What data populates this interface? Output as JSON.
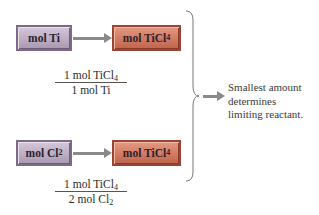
{
  "diagram": {
    "row1": {
      "from_box": {
        "text": "mol Ti",
        "color": "#bcaec4"
      },
      "to_box": {
        "text": "mol TiCl",
        "sub": "4",
        "color": "#d27a62"
      },
      "factor": {
        "numerator": {
          "text": "1 mol TiCl",
          "sub": "4"
        },
        "denominator": {
          "text": "1 mol Ti",
          "sub": ""
        }
      }
    },
    "row2": {
      "from_box": {
        "text": "mol Cl",
        "sub": "2",
        "color": "#bcaec4"
      },
      "to_box": {
        "text": "mol TiCl",
        "sub": "4",
        "color": "#d27a62"
      },
      "factor": {
        "numerator": {
          "text": "1 mol TiCl",
          "sub": "4"
        },
        "denominator": {
          "text": "2 mol Cl",
          "sub": "2"
        }
      }
    },
    "conclusion": {
      "lines": [
        "Smallest amount",
        "determines",
        "limiting reactant."
      ]
    },
    "arrow_color": "#8a8a8a"
  }
}
